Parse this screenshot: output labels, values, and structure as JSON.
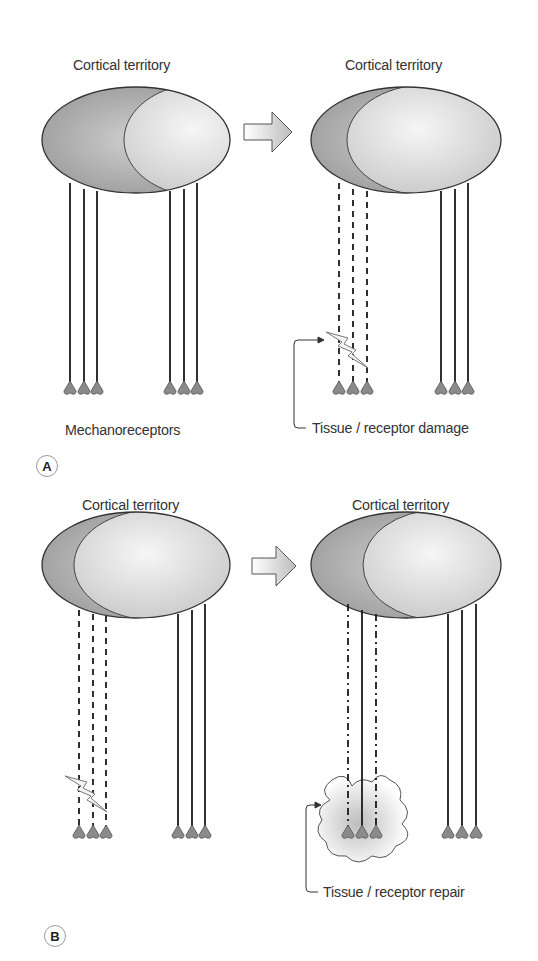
{
  "figure": {
    "panel_a": {
      "badge": "A",
      "left": {
        "title": "Cortical territory",
        "bottom_label": "Mechanoreceptors",
        "fibers_left_group": "solid",
        "fibers_right_group": "solid"
      },
      "right": {
        "title": "Cortical territory",
        "callout": "Tissue / receptor damage",
        "fibers_left_group": "dashed",
        "fibers_right_group": "solid"
      }
    },
    "panel_b": {
      "badge": "B",
      "left": {
        "title": "Cortical territory",
        "fibers_left_group": "dashed",
        "fibers_right_group": "solid"
      },
      "right": {
        "title": "Cortical territory",
        "callout": "Tissue / receptor repair",
        "fibers_left_group": "dash-dot / solid / dash-dot",
        "fibers_right_group": "solid"
      }
    },
    "colors": {
      "line": "#1a1a1a",
      "text": "#333333",
      "receptor_fill": "#8a8a8a",
      "ellipse_dark": "#9c9c9c",
      "ellipse_light": "#e8e8e8",
      "badge_border": "#9a9a9a"
    }
  }
}
